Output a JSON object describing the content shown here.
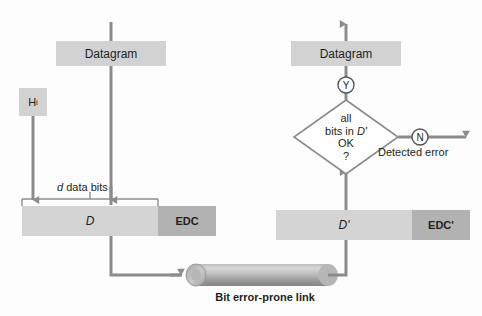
{
  "figure": {
    "background": "#fdfdfd"
  },
  "colors": {
    "box_light": "#d3d3d3",
    "box_mid": "#c8c8c8",
    "box_dark": "#b0b0b0",
    "line": "#8c8c8c",
    "outline": "#808080",
    "text": "#231f20",
    "cylinder_light": "#cfcfcf",
    "cylinder_dark": "#8f8f8f",
    "white": "#ffffff"
  },
  "sender": {
    "datagram_label": "Datagram",
    "header_label": "H",
    "header_subscript": "i",
    "data_field_label": "D",
    "edc_field_label": "EDC",
    "bracket_label_italic": "d",
    "bracket_label_rest": " data bits"
  },
  "link": {
    "label": "Bit error-prone link"
  },
  "receiver": {
    "datagram_label": "Datagram",
    "data_field_label": "D'",
    "edc_field_label": "EDC'",
    "decision_line_1": "all",
    "decision_line_2_plain": "bits in ",
    "decision_line_2_italic": "D'",
    "decision_line_3": "OK",
    "decision_line_4": "?",
    "yes_label": "Y",
    "no_label": "N",
    "error_label": "Detected error"
  }
}
